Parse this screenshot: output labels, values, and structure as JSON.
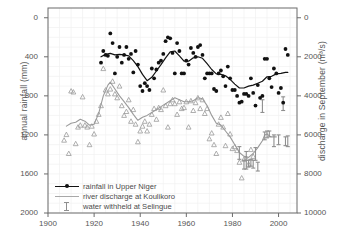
{
  "chart_data": {
    "type": "scatter",
    "title": "",
    "xlabel": "",
    "ylabel": "annual rainfall (mm)",
    "ylabel_right": "discharge in September (m³/s)",
    "xlim": [
      1900,
      2008
    ],
    "ylim": [
      0,
      2100
    ],
    "ylim_right": [
      0,
      10500
    ],
    "grid": true,
    "legend_position": "lower-left-inside",
    "xticks": [
      1900,
      1920,
      1940,
      1960,
      1980,
      2000
    ],
    "yticks_left": [
      0,
      400,
      800,
      1200,
      1600,
      2000
    ],
    "yticks_right": [
      0,
      2000,
      4000,
      6000,
      8000,
      10000
    ],
    "colors": {
      "rainfall": "#111111",
      "discharge": "#9a9a9a",
      "withheld": "#8f8f8f",
      "axis": "#6b6b6b",
      "text": "#555555",
      "grid": "#f0f0f0"
    },
    "series": [
      {
        "name": "rainfall in Upper Niger",
        "axis": "left",
        "marker": "filled-circle",
        "color": "#111111",
        "points": [
          [
            1923,
            1540
          ],
          [
            1924,
            1660
          ],
          [
            1925,
            1620
          ],
          [
            1926,
            1610
          ],
          [
            1927,
            1840
          ],
          [
            1928,
            1740
          ],
          [
            1929,
            1430
          ],
          [
            1930,
            1600
          ],
          [
            1931,
            1700
          ],
          [
            1932,
            1540
          ],
          [
            1933,
            1620
          ],
          [
            1934,
            1700
          ],
          [
            1935,
            1580
          ],
          [
            1936,
            1630
          ],
          [
            1937,
            1440
          ],
          [
            1938,
            1660
          ],
          [
            1939,
            1520
          ],
          [
            1940,
            1300
          ],
          [
            1941,
            1250
          ],
          [
            1942,
            1330
          ],
          [
            1943,
            1300
          ],
          [
            1944,
            1260
          ],
          [
            1945,
            1480
          ],
          [
            1946,
            1380
          ],
          [
            1947,
            1470
          ],
          [
            1948,
            1540
          ],
          [
            1949,
            1560
          ],
          [
            1950,
            1630
          ],
          [
            1951,
            1760
          ],
          [
            1952,
            1800
          ],
          [
            1953,
            1790
          ],
          [
            1954,
            1640
          ],
          [
            1955,
            1430
          ],
          [
            1956,
            1740
          ],
          [
            1957,
            1660
          ],
          [
            1958,
            1430
          ],
          [
            1959,
            1430
          ],
          [
            1960,
            1560
          ],
          [
            1961,
            1520
          ],
          [
            1962,
            1690
          ],
          [
            1963,
            1640
          ],
          [
            1964,
            1600
          ],
          [
            1965,
            1700
          ],
          [
            1966,
            1720
          ],
          [
            1967,
            1620
          ],
          [
            1968,
            1380
          ],
          [
            1969,
            1430
          ],
          [
            1970,
            1430
          ],
          [
            1971,
            1430
          ],
          [
            1972,
            1270
          ],
          [
            1973,
            1250
          ],
          [
            1974,
            1430
          ],
          [
            1975,
            1460
          ],
          [
            1976,
            1400
          ],
          [
            1977,
            1300
          ],
          [
            1978,
            1500
          ],
          [
            1979,
            1380
          ],
          [
            1980,
            1260
          ],
          [
            1981,
            1260
          ],
          [
            1982,
            1200
          ],
          [
            1983,
            1130
          ],
          [
            1984,
            1140
          ],
          [
            1985,
            1220
          ],
          [
            1986,
            1220
          ],
          [
            1987,
            1200
          ],
          [
            1988,
            1380
          ],
          [
            1989,
            1230
          ],
          [
            1990,
            1100
          ],
          [
            1991,
            1310
          ],
          [
            1992,
            1180
          ],
          [
            1993,
            1200
          ],
          [
            1994,
            1580
          ],
          [
            1995,
            1580
          ],
          [
            1996,
            1380
          ],
          [
            1997,
            1290
          ],
          [
            1998,
            1480
          ],
          [
            1999,
            1430
          ],
          [
            2000,
            1230
          ],
          [
            2001,
            1280
          ],
          [
            2002,
            1130
          ],
          [
            2003,
            1680
          ],
          [
            2004,
            1620
          ]
        ],
        "smooth_line": [
          [
            1923,
            1600
          ],
          [
            1925,
            1625
          ],
          [
            1927,
            1635
          ],
          [
            1929,
            1620
          ],
          [
            1931,
            1625
          ],
          [
            1933,
            1620
          ],
          [
            1935,
            1610
          ],
          [
            1937,
            1560
          ],
          [
            1939,
            1500
          ],
          [
            1941,
            1420
          ],
          [
            1943,
            1355
          ],
          [
            1945,
            1390
          ],
          [
            1947,
            1455
          ],
          [
            1949,
            1520
          ],
          [
            1951,
            1590
          ],
          [
            1953,
            1650
          ],
          [
            1955,
            1660
          ],
          [
            1957,
            1610
          ],
          [
            1959,
            1555
          ],
          [
            1961,
            1555
          ],
          [
            1963,
            1590
          ],
          [
            1965,
            1600
          ],
          [
            1967,
            1585
          ],
          [
            1969,
            1530
          ],
          [
            1971,
            1470
          ],
          [
            1973,
            1425
          ],
          [
            1975,
            1420
          ],
          [
            1977,
            1405
          ],
          [
            1979,
            1370
          ],
          [
            1981,
            1320
          ],
          [
            1983,
            1280
          ],
          [
            1985,
            1280
          ],
          [
            1987,
            1300
          ],
          [
            1989,
            1310
          ],
          [
            1991,
            1330
          ],
          [
            1993,
            1350
          ],
          [
            1995,
            1395
          ],
          [
            1997,
            1400
          ],
          [
            1999,
            1425
          ],
          [
            2001,
            1430
          ],
          [
            2003,
            1440
          ],
          [
            2004,
            1440
          ]
        ]
      },
      {
        "name": "river discharge at Koulikoro",
        "axis": "right",
        "marker": "open-triangle",
        "color": "#9a9a9a",
        "points": [
          [
            1907,
            3730
          ],
          [
            1908,
            4020
          ],
          [
            1909,
            3050
          ],
          [
            1910,
            6250
          ],
          [
            1911,
            6200
          ],
          [
            1912,
            3550
          ],
          [
            1913,
            4400
          ],
          [
            1914,
            4500
          ],
          [
            1915,
            5950
          ],
          [
            1916,
            4500
          ],
          [
            1917,
            4400
          ],
          [
            1918,
            3500
          ],
          [
            1919,
            4450
          ],
          [
            1920,
            4050
          ],
          [
            1921,
            4700
          ],
          [
            1922,
            5050
          ],
          [
            1923,
            5500
          ],
          [
            1924,
            7400
          ],
          [
            1925,
            6300
          ],
          [
            1926,
            6100
          ],
          [
            1927,
            6350
          ],
          [
            1928,
            6750
          ],
          [
            1929,
            6100
          ],
          [
            1930,
            5900
          ],
          [
            1931,
            6500
          ],
          [
            1932,
            5500
          ],
          [
            1933,
            5000
          ],
          [
            1934,
            5200
          ],
          [
            1935,
            5800
          ],
          [
            1936,
            4700
          ],
          [
            1937,
            5300
          ],
          [
            1938,
            4550
          ],
          [
            1939,
            3650
          ],
          [
            1940,
            4200
          ],
          [
            1941,
            4450
          ],
          [
            1942,
            4700
          ],
          [
            1943,
            4200
          ],
          [
            1944,
            4550
          ],
          [
            1945,
            5050
          ],
          [
            1946,
            5350
          ],
          [
            1947,
            4800
          ],
          [
            1948,
            5400
          ],
          [
            1949,
            5300
          ],
          [
            1950,
            6300
          ],
          [
            1951,
            5500
          ],
          [
            1952,
            4400
          ],
          [
            1953,
            5600
          ],
          [
            1954,
            5800
          ],
          [
            1955,
            5600
          ],
          [
            1956,
            5050
          ],
          [
            1957,
            5700
          ],
          [
            1958,
            5350
          ],
          [
            1959,
            5400
          ],
          [
            1960,
            5700
          ],
          [
            1961,
            4400
          ],
          [
            1962,
            5750
          ],
          [
            1963,
            5250
          ],
          [
            1964,
            5650
          ],
          [
            1965,
            5900
          ],
          [
            1966,
            5350
          ],
          [
            1967,
            5800
          ],
          [
            1968,
            5100
          ],
          [
            1969,
            5350
          ],
          [
            1970,
            3800
          ],
          [
            1971,
            4100
          ],
          [
            1972,
            3500
          ],
          [
            1973,
            3050
          ],
          [
            1974,
            4550
          ],
          [
            1975,
            4900
          ],
          [
            1976,
            4400
          ],
          [
            1977,
            3450
          ],
          [
            1978,
            5100
          ],
          [
            1979,
            4050
          ],
          [
            1980,
            3300
          ],
          [
            1981,
            3400
          ],
          [
            1982,
            3200
          ],
          [
            1983,
            2600
          ],
          [
            1984,
            1800
          ],
          [
            1985,
            2750
          ],
          [
            1986,
            2800
          ],
          [
            1987,
            2500
          ],
          [
            1988,
            3250
          ],
          [
            1989,
            2900
          ]
        ],
        "smooth_line": [
          [
            1908,
            4450
          ],
          [
            1910,
            4600
          ],
          [
            1912,
            4650
          ],
          [
            1914,
            4800
          ],
          [
            1916,
            4700
          ],
          [
            1918,
            4500
          ],
          [
            1920,
            4550
          ],
          [
            1922,
            5100
          ],
          [
            1924,
            6000
          ],
          [
            1926,
            6550
          ],
          [
            1927,
            6700
          ],
          [
            1929,
            6350
          ],
          [
            1931,
            6000
          ],
          [
            1933,
            5700
          ],
          [
            1935,
            5400
          ],
          [
            1937,
            5050
          ],
          [
            1939,
            4750
          ],
          [
            1941,
            4900
          ],
          [
            1943,
            5000
          ],
          [
            1945,
            5150
          ],
          [
            1947,
            5300
          ],
          [
            1949,
            5450
          ],
          [
            1951,
            5600
          ],
          [
            1953,
            5750
          ],
          [
            1955,
            5900
          ],
          [
            1957,
            5800
          ],
          [
            1959,
            5700
          ],
          [
            1961,
            5700
          ],
          [
            1963,
            5750
          ],
          [
            1965,
            5900
          ],
          [
            1967,
            5850
          ],
          [
            1969,
            5500
          ],
          [
            1971,
            5000
          ],
          [
            1973,
            4600
          ],
          [
            1975,
            4500
          ],
          [
            1977,
            4200
          ],
          [
            1979,
            3900
          ],
          [
            1981,
            3500
          ],
          [
            1983,
            3100
          ],
          [
            1985,
            2900
          ],
          [
            1987,
            2850
          ],
          [
            1989,
            3050
          ],
          [
            1991,
            3350
          ],
          [
            1993,
            3700
          ],
          [
            1994,
            4000
          ],
          [
            1995,
            4050
          ],
          [
            1996,
            3950
          ],
          [
            1997,
            3900
          ],
          [
            1998,
            3900
          ],
          [
            1999,
            3900
          ]
        ]
      },
      {
        "name": "water withheld at Selingue",
        "axis": "right",
        "marker": "i-bar",
        "color": "#8f8f8f",
        "bars": [
          {
            "year": 1983,
            "low": 2750,
            "high": 3400
          },
          {
            "year": 1985,
            "low": 2250,
            "high": 2700
          },
          {
            "year": 1986,
            "low": 2250,
            "high": 3150
          },
          {
            "year": 1987,
            "low": 2350,
            "high": 2700
          },
          {
            "year": 1988,
            "low": 2400,
            "high": 2750
          },
          {
            "year": 1989,
            "low": 2300,
            "high": 2700
          },
          {
            "year": 1990,
            "low": 2700,
            "high": 3350
          },
          {
            "year": 1991,
            "low": 2150,
            "high": 2600
          },
          {
            "year": 1993,
            "low": 5150,
            "high": 5800
          },
          {
            "year": 1994,
            "low": 3750,
            "high": 4150
          },
          {
            "year": 1995,
            "low": 3850,
            "high": 4200
          },
          {
            "year": 1996,
            "low": 3900,
            "high": 4200
          },
          {
            "year": 1998,
            "low": 3400,
            "high": 4000
          },
          {
            "year": 2000,
            "low": 3500,
            "high": 4000
          },
          {
            "year": 2002,
            "low": 5250,
            "high": 5950
          },
          {
            "year": 2003,
            "low": 3450,
            "high": 3900
          },
          {
            "year": 2004,
            "low": 3400,
            "high": 3950
          }
        ]
      }
    ]
  },
  "axes": {
    "left_title": "annual rainfall (mm)",
    "right_title": "discharge in September (m³/s)",
    "left_ticks": [
      "2000",
      "1600",
      "1200",
      "800",
      "400",
      "0"
    ],
    "right_ticks": [
      "10000",
      "8000",
      "6000",
      "4000",
      "2000",
      "0"
    ],
    "bottom_ticks": [
      "1900",
      "1920",
      "1940",
      "1960",
      "1980",
      "2000"
    ]
  },
  "legend": {
    "items": [
      {
        "label": "rainfall in Upper Niger",
        "key": "line-with-dot"
      },
      {
        "label": "river discharge at Koulikoro",
        "key": "gray-line"
      },
      {
        "label": "water withheld at Selingue",
        "key": "i-bar"
      }
    ]
  }
}
